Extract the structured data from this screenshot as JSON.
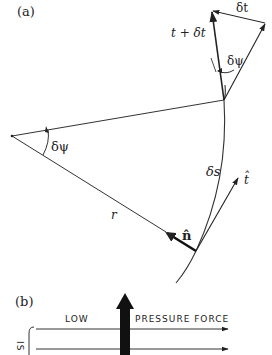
{
  "panel_a": {
    "label": "(a)",
    "labels": {
      "t_plus_dt": "t + δt",
      "dt": "δt",
      "dpsi_top": "δψ",
      "dpsi_left": "δψ",
      "ds": "δs",
      "t_hat": "t̂",
      "n_hat": "n̂",
      "r": "r"
    }
  },
  "panel_b": {
    "label": "(b)",
    "low_label": "LOW",
    "force_label": "PRESSURE FORCE",
    "side_label": "IS"
  },
  "colors": {
    "ink": "#222222",
    "background": "#ffffff"
  }
}
